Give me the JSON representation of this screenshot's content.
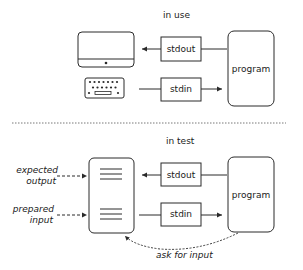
{
  "sections": {
    "in_use": {
      "title": "in use",
      "stdout_label": "stdout",
      "stdin_label": "stdin",
      "program_label": "program",
      "devices": [
        "monitor-icon",
        "keyboard-icon"
      ]
    },
    "in_test": {
      "title": "in test",
      "stdout_label": "stdout",
      "stdin_label": "stdin",
      "program_label": "program",
      "expected_output_line1": "expected",
      "expected_output_line2": "output",
      "prepared_input_line1": "prepared",
      "prepared_input_line2": "input",
      "ask_for_input": "ask for input",
      "document": "test-file-icon"
    }
  },
  "colors": {
    "stroke": "#2a2a2a",
    "background": "#ffffff",
    "separator": "#555555"
  }
}
